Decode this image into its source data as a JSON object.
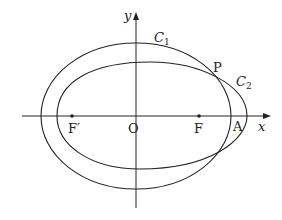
{
  "diagram": {
    "type": "conic-diagram",
    "axes": {
      "x_label": "x",
      "y_label": "y",
      "origin_label": "O"
    },
    "curves": [
      {
        "name": "C1",
        "label_main": "C",
        "label_sub": "1",
        "shape": "ellipse centered at origin"
      },
      {
        "name": "C2",
        "label_main": "C",
        "label_sub": "2",
        "shape": "ellipse sharing focus region, shifted right"
      }
    ],
    "points": [
      {
        "label": "F′",
        "role": "left focus"
      },
      {
        "label": "F",
        "role": "right focus"
      },
      {
        "label": "A",
        "role": "right vertex of C1 on x-axis"
      },
      {
        "label": "P",
        "role": "intersection of C1 and C2"
      }
    ],
    "colors": {
      "stroke": "#222222",
      "background": "#ffffff"
    }
  }
}
